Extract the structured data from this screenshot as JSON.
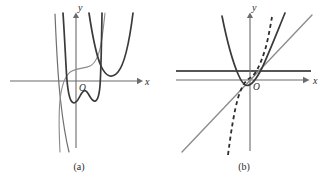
{
  "figure": {
    "background_color": "#ffffff",
    "width": 326,
    "height": 178,
    "panels": [
      {
        "id": "a",
        "caption": "(a)",
        "caption_x": 79,
        "caption_y": 168,
        "x_axis_label": "x",
        "y_axis_label": "y",
        "origin_label": "O",
        "origin_x": 76,
        "origin_y": 81,
        "x_axis": {
          "x1": 10,
          "x2": 140,
          "y": 81,
          "arrow_at": "right"
        },
        "y_axis": {
          "x": 76,
          "y1": 147,
          "y2": 14,
          "arrow_at": "top"
        },
        "x_label_pos": {
          "x": 144,
          "y": 84
        },
        "y_label_pos": {
          "x": 78,
          "y": 11
        },
        "curves": [
          {
            "name": "steep-cubic-left",
            "color": "#6f6f6f",
            "style": "solid",
            "weight": "mid"
          },
          {
            "name": "wavy-cubic-center",
            "color": "#8a8a8a",
            "style": "solid",
            "weight": "light"
          },
          {
            "name": "parabola-right",
            "color": "#3a3a3a",
            "style": "solid",
            "weight": "dark"
          },
          {
            "name": "steep-branch-inner",
            "color": "#3a3a3a",
            "style": "solid",
            "weight": "dark"
          }
        ]
      },
      {
        "id": "b",
        "caption": "(b)",
        "caption_x": 244,
        "caption_y": 168,
        "x_axis_label": "x",
        "y_axis_label": "y",
        "origin_label": "O",
        "origin_x": 250,
        "origin_y": 80,
        "x_axis": {
          "x1": 176,
          "x2": 310,
          "y": 80,
          "arrow_at": "right"
        },
        "y_axis": {
          "x": 250,
          "y1": 150,
          "y2": 14,
          "arrow_at": "top"
        },
        "x_label_pos": {
          "x": 315,
          "y": 83
        },
        "y_label_pos": {
          "x": 252,
          "y": 11
        },
        "curves": [
          {
            "name": "parabola",
            "color": "#3a3a3a",
            "style": "solid",
            "weight": "dark"
          },
          {
            "name": "tangent-line",
            "color": "#8d8d8d",
            "style": "solid",
            "weight": "line"
          },
          {
            "name": "horizontal-level-line",
            "color": "#555555",
            "style": "solid",
            "weight": "hline",
            "y": 71,
            "x1": 176,
            "x2": 311
          },
          {
            "name": "dashed-steep-curve",
            "color": "#2e2e2e",
            "style": "dashed",
            "weight": "dark"
          }
        ]
      }
    ]
  },
  "colors": {
    "axis": "#6b6b6b",
    "dark_curve": "#3a3a3a",
    "mid_curve": "#6f6f6f",
    "light_curve": "#8a8a8a",
    "gray_line": "#8d8d8d",
    "level_line": "#555555",
    "dashed_curve": "#2e2e2e",
    "text": "#2b2b2b",
    "background": "#ffffff"
  }
}
